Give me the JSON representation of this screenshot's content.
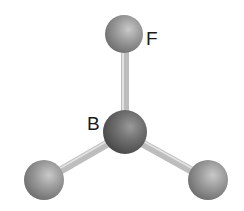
{
  "molecule": {
    "name": "BF3",
    "atoms": [
      {
        "id": "B",
        "label": "B",
        "cx": 125,
        "cy": 132,
        "r": 22,
        "color": "#6e6e6e"
      },
      {
        "id": "F1",
        "label": "F",
        "cx": 124,
        "cy": 34,
        "r": 19,
        "color": "#9a9a9a"
      },
      {
        "id": "F2",
        "label": "",
        "cx": 44,
        "cy": 180,
        "r": 20,
        "color": "#9a9a9a"
      },
      {
        "id": "F3",
        "label": "",
        "cx": 208,
        "cy": 180,
        "r": 20,
        "color": "#9a9a9a"
      }
    ],
    "labels": {
      "boron": "B",
      "fluorine": "F"
    }
  }
}
